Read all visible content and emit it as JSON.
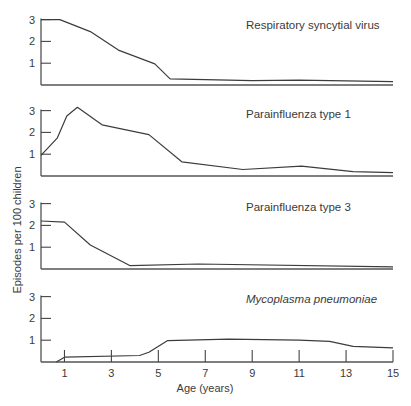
{
  "chart_data": {
    "type": "line",
    "layout": "four vertically stacked panels sharing x-axis",
    "xlabel": "Age (years)",
    "ylabel": "Episodes per 100 children",
    "xlim": [
      0,
      15
    ],
    "ylim": [
      0,
      3
    ],
    "x_ticks": [
      1,
      3,
      5,
      7,
      9,
      11,
      13,
      15
    ],
    "y_ticks": [
      1,
      2,
      3
    ],
    "grid": false,
    "panels": [
      {
        "title": "Respiratory syncytial virus",
        "italic": false,
        "x": [
          0,
          0.8,
          2.1,
          3.3,
          4.85,
          5.5,
          9,
          11,
          15
        ],
        "values": [
          3.0,
          3.0,
          2.45,
          1.6,
          0.97,
          0.28,
          0.2,
          0.22,
          0.15
        ]
      },
      {
        "title": "Parainfluenza type 1",
        "italic": false,
        "x": [
          0,
          0.7,
          1.1,
          1.55,
          2.6,
          4.6,
          6.0,
          8.6,
          11.1,
          13.3,
          15
        ],
        "values": [
          0.95,
          1.75,
          2.75,
          3.15,
          2.35,
          1.9,
          0.65,
          0.3,
          0.45,
          0.2,
          0.15
        ]
      },
      {
        "title": "Parainfluenza type 3",
        "italic": false,
        "x": [
          0,
          1.0,
          2.1,
          3.8,
          6.7,
          15
        ],
        "values": [
          2.2,
          2.15,
          1.1,
          0.15,
          0.23,
          0.1
        ]
      },
      {
        "title": "Mycoplasma pneumoniae",
        "italic": true,
        "x": [
          0.65,
          1.0,
          4.2,
          4.6,
          5.4,
          8.0,
          11.0,
          12.3,
          13.3,
          15
        ],
        "values": [
          0,
          0.22,
          0.3,
          0.45,
          0.98,
          1.05,
          1.0,
          0.95,
          0.72,
          0.65
        ]
      }
    ]
  }
}
